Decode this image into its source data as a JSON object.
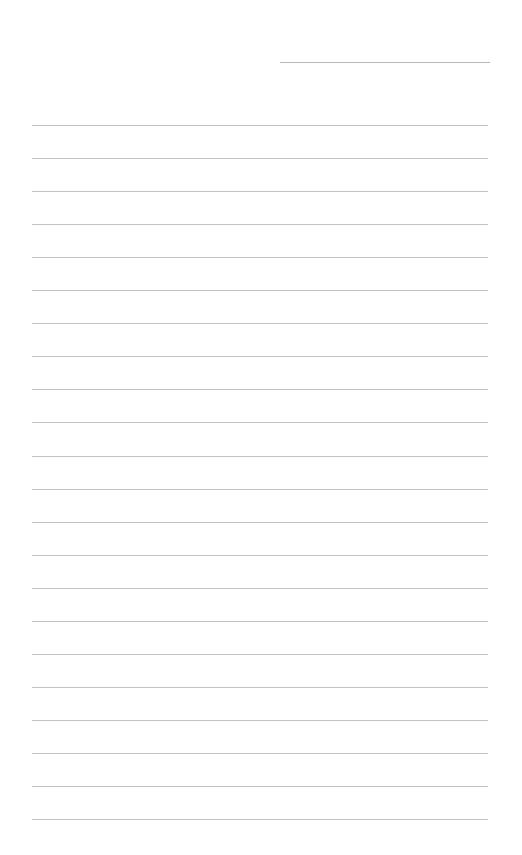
{
  "page": {
    "type": "lined-paper",
    "background_color": "#ffffff",
    "line_color": "#c2c2c2",
    "header_line": {
      "label": ""
    },
    "ruled_line_count": 22
  }
}
